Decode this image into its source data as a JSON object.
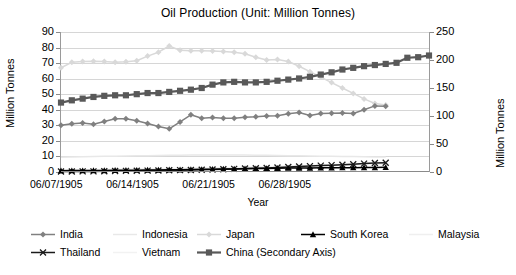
{
  "chart_data": {
    "type": "line",
    "title": "Oil Production (Unit: Million Tonnes)",
    "xlabel": "Year",
    "ylabel": "Million Tonnes",
    "ylabel_secondary": "Million Tonnes",
    "grid": true,
    "legend_position": "bottom",
    "ylim": [
      0,
      90
    ],
    "ylim_secondary": [
      0,
      250
    ],
    "yticks": [
      0,
      10,
      20,
      30,
      40,
      50,
      60,
      70,
      80,
      90
    ],
    "yticks_secondary": [
      0,
      50,
      100,
      150,
      200,
      250
    ],
    "xtick_labels": [
      "06/07/1905",
      "06/14/1905",
      "06/21/1905",
      "06/28/1905"
    ],
    "xtick_positions": [
      0,
      7,
      14,
      21
    ],
    "x_count": 31,
    "series": [
      {
        "name": "India",
        "axis": "primary",
        "color": "#808080",
        "marker": "diamond",
        "values": [
          30.0,
          31.0,
          31.5,
          30.7,
          32.5,
          34.2,
          34.3,
          33.0,
          31.2,
          29.3,
          27.8,
          32.2,
          36.8,
          34.6,
          35.0,
          34.6,
          34.5,
          35.2,
          35.5,
          36.0,
          36.2,
          37.4,
          38.2,
          36.3,
          37.6,
          37.8,
          38.0,
          37.6,
          40.0,
          42.5,
          42.2
        ]
      },
      {
        "name": "Indonesia",
        "axis": "primary",
        "color": "#e8e8e8",
        "marker": "none",
        "values": [
          9.5,
          9.7,
          9.8,
          10.0,
          10.1,
          10.2,
          10.3,
          10.4,
          10.5,
          10.6,
          10.7,
          10.8,
          10.9,
          11.0,
          11.0,
          11.0,
          11.0,
          10.9,
          10.8,
          10.7,
          10.6,
          10.5,
          10.4,
          10.3,
          10.2,
          10.1,
          10.0,
          9.9,
          9.8,
          9.7,
          9.6
        ]
      },
      {
        "name": "Japan",
        "axis": "primary",
        "color": "#d9d9d9",
        "marker": "diamond",
        "values": [
          67.0,
          70.5,
          71.0,
          71.2,
          71.0,
          70.6,
          70.8,
          71.5,
          74.5,
          77.0,
          81.0,
          78.2,
          78.0,
          78.0,
          77.8,
          77.5,
          77.0,
          76.0,
          73.8,
          72.0,
          72.3,
          71.0,
          68.0,
          64.5,
          61.0,
          57.5,
          54.0,
          50.5,
          47.0,
          44.0,
          43.0
        ]
      },
      {
        "name": "South Korea",
        "axis": "primary",
        "color": "#000000",
        "marker": "triangle",
        "values": [
          0.8,
          0.9,
          0.9,
          1.0,
          1.0,
          1.1,
          1.1,
          1.2,
          1.3,
          1.3,
          1.4,
          1.5,
          1.6,
          1.7,
          1.8,
          1.9,
          2.0,
          2.1,
          2.2,
          2.3,
          2.4,
          2.5,
          2.6,
          2.6,
          2.7,
          2.7,
          2.8,
          2.8,
          2.9,
          2.9,
          3.0
        ]
      },
      {
        "name": "Malaysia",
        "axis": "primary",
        "color": "#efefef",
        "marker": "none",
        "values": [
          1.2,
          1.3,
          1.4,
          1.5,
          1.6,
          1.7,
          1.8,
          1.9,
          2.0,
          2.1,
          2.2,
          2.3,
          2.4,
          2.5,
          2.6,
          2.7,
          2.8,
          3.0,
          3.2,
          3.4,
          3.6,
          3.8,
          4.0,
          4.2,
          4.4,
          4.6,
          4.8,
          5.0,
          5.2,
          5.4,
          5.5
        ]
      },
      {
        "name": "Thailand",
        "axis": "primary",
        "color": "#1a1a1a",
        "marker": "cross",
        "values": [
          0.3,
          0.3,
          0.4,
          0.4,
          0.5,
          0.6,
          0.7,
          0.8,
          0.9,
          1.0,
          1.1,
          1.2,
          1.3,
          1.4,
          1.6,
          1.8,
          2.0,
          2.2,
          2.4,
          2.6,
          2.9,
          3.2,
          3.5,
          3.8,
          4.1,
          4.4,
          4.7,
          5.0,
          5.4,
          5.8,
          6.0
        ]
      },
      {
        "name": "Vietnam",
        "axis": "primary",
        "color": "#f2f2f2",
        "marker": "none",
        "values": [
          0.2,
          0.3,
          0.4,
          0.5,
          0.6,
          0.7,
          0.8,
          0.9,
          1.0,
          1.1,
          1.2,
          1.4,
          1.6,
          1.8,
          2.0,
          2.2,
          2.4,
          2.6,
          2.8,
          3.0,
          3.2,
          3.4,
          3.6,
          3.8,
          4.0,
          4.2,
          4.4,
          4.6,
          4.8,
          5.0,
          5.2
        ]
      },
      {
        "name": "China (Secondary Axis)",
        "axis": "secondary",
        "color": "#595959",
        "marker": "square",
        "values": [
          124,
          128,
          131,
          134,
          136,
          137,
          137,
          139,
          141,
          141,
          143,
          145,
          147,
          150,
          156,
          160,
          161,
          160,
          160,
          161,
          163,
          165,
          167,
          170,
          174,
          178,
          183,
          186,
          189,
          191,
          193,
          195,
          204,
          205,
          208
        ]
      }
    ]
  },
  "legend": {
    "rows": [
      [
        {
          "label": "India",
          "key": "line-marker-diamond",
          "color": "#808080"
        },
        {
          "label": "Indonesia",
          "key": "line-plain",
          "color": "#e8e8e8"
        },
        {
          "label": "Japan",
          "key": "line-marker-diamond",
          "color": "#d9d9d9"
        },
        {
          "label": "South Korea",
          "key": "line-marker-triangle",
          "color": "#000000"
        },
        {
          "label": "Malaysia",
          "key": "line-plain",
          "color": "#efefef"
        }
      ],
      [
        {
          "label": "Thailand",
          "key": "line-marker-cross",
          "color": "#1a1a1a"
        },
        {
          "label": "Vietnam",
          "key": "line-plain",
          "color": "#f2f2f2"
        },
        {
          "label": "China (Secondary Axis)",
          "key": "line-marker-square",
          "color": "#595959"
        }
      ]
    ]
  }
}
